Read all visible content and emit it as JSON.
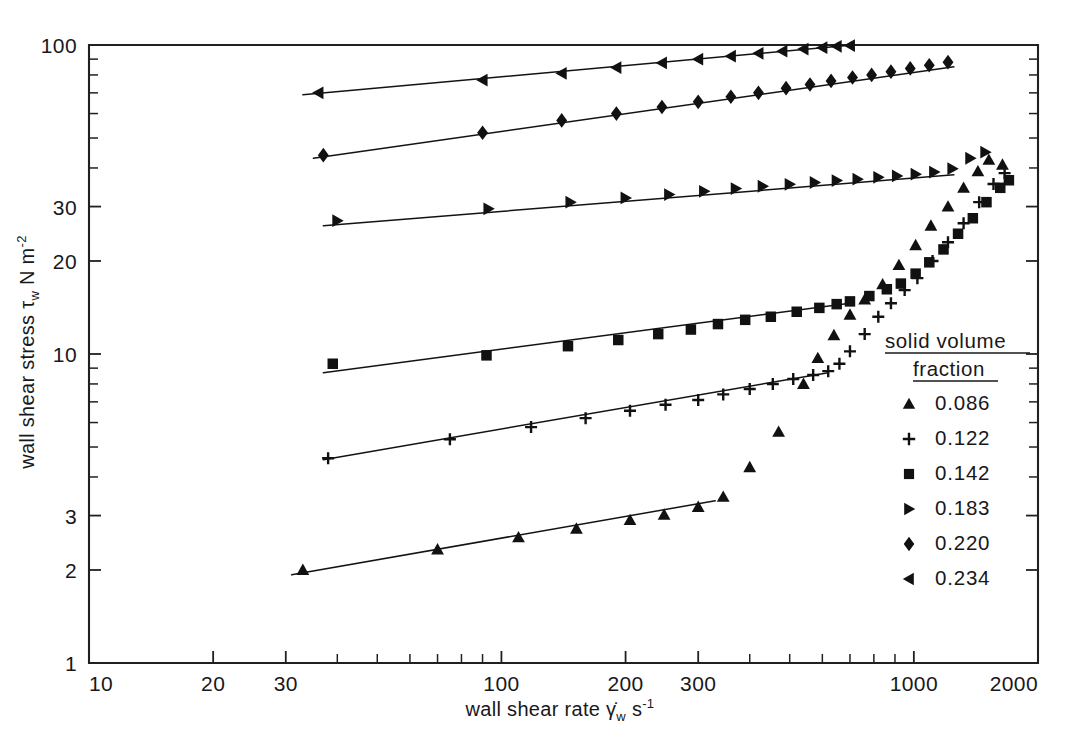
{
  "figure": {
    "background": "#ffffff",
    "ink_color": "#18181a"
  },
  "axes": {
    "x": {
      "title_prefix": "wall shear rate",
      "symbol": "γ̇",
      "symbol_sub": "w",
      "unit": "s",
      "unit_exponent": "-1",
      "scale": "log",
      "min": 10,
      "max": 2000,
      "tick_labels": [
        "10",
        "20",
        "30",
        "100",
        "200",
        "300",
        "1000",
        "2000"
      ],
      "tick_values": [
        10,
        20,
        30,
        100,
        200,
        300,
        1000,
        2000
      ],
      "minor_ticks": [
        40,
        50,
        60,
        70,
        80,
        90,
        400,
        500,
        600,
        700,
        800,
        900
      ]
    },
    "y": {
      "title_prefix": "wall shear stress",
      "symbol": "τ",
      "symbol_sub": "w",
      "unit": "N m",
      "unit_exponent": "-2",
      "scale": "log",
      "min": 1,
      "max": 100,
      "tick_labels": [
        "100",
        "30",
        "20",
        "10",
        "3",
        "2",
        "1"
      ],
      "tick_values": [
        100,
        30,
        20,
        10,
        3,
        2,
        1
      ],
      "minor_ticks": [
        90,
        80,
        70,
        60,
        50,
        40,
        9,
        8,
        7,
        6,
        5,
        4
      ]
    }
  },
  "legend": {
    "title_line1": "solid  volume",
    "title_line2": "fraction",
    "entries": [
      {
        "marker": "triangle-up",
        "label": "0.086"
      },
      {
        "marker": "plus",
        "label": "0.122"
      },
      {
        "marker": "square",
        "label": "0.142"
      },
      {
        "marker": "triangle-right",
        "label": "0.183"
      },
      {
        "marker": "diamond",
        "label": "0.220"
      },
      {
        "marker": "triangle-left",
        "label": "0.234"
      }
    ]
  },
  "chart_data": {
    "type": "scatter",
    "title": "",
    "xlabel": "wall shear rate γ̇w s⁻¹",
    "ylabel": "wall shear stress τw N m⁻²",
    "xscale": "log",
    "yscale": "log",
    "xlim": [
      10,
      2000
    ],
    "ylim": [
      1,
      100
    ],
    "grid": false,
    "legend_position": "right-inside",
    "legend_title": "solid volume fraction",
    "series": [
      {
        "name": "0.086",
        "marker": "triangle-up",
        "has_fit_line": true,
        "fit_line": {
          "x": [
            31,
            330
          ],
          "y": [
            1.93,
            3.35
          ]
        },
        "points": [
          {
            "x": 33,
            "y": 2.0
          },
          {
            "x": 70,
            "y": 2.33
          },
          {
            "x": 110,
            "y": 2.55
          },
          {
            "x": 152,
            "y": 2.72
          },
          {
            "x": 205,
            "y": 2.9
          },
          {
            "x": 248,
            "y": 3.02
          },
          {
            "x": 300,
            "y": 3.2
          },
          {
            "x": 345,
            "y": 3.45
          },
          {
            "x": 400,
            "y": 4.3
          },
          {
            "x": 470,
            "y": 5.6
          },
          {
            "x": 540,
            "y": 8.0
          },
          {
            "x": 585,
            "y": 9.7
          },
          {
            "x": 640,
            "y": 11.5
          },
          {
            "x": 700,
            "y": 13.4
          },
          {
            "x": 760,
            "y": 15.0
          },
          {
            "x": 840,
            "y": 16.8
          },
          {
            "x": 920,
            "y": 19.4
          },
          {
            "x": 1010,
            "y": 22.5
          },
          {
            "x": 1100,
            "y": 26.0
          },
          {
            "x": 1210,
            "y": 30.0
          },
          {
            "x": 1320,
            "y": 34.5
          },
          {
            "x": 1430,
            "y": 39.0
          },
          {
            "x": 1520,
            "y": 42.5
          },
          {
            "x": 1640,
            "y": 41.0
          }
        ]
      },
      {
        "name": "0.122",
        "marker": "plus",
        "has_fit_line": true,
        "fit_line": {
          "x": [
            37,
            620
          ],
          "y": [
            4.55,
            8.7
          ]
        },
        "points": [
          {
            "x": 38,
            "y": 4.6
          },
          {
            "x": 75,
            "y": 5.3
          },
          {
            "x": 118,
            "y": 5.8
          },
          {
            "x": 160,
            "y": 6.2
          },
          {
            "x": 205,
            "y": 6.55
          },
          {
            "x": 250,
            "y": 6.85
          },
          {
            "x": 300,
            "y": 7.1
          },
          {
            "x": 345,
            "y": 7.4
          },
          {
            "x": 400,
            "y": 7.7
          },
          {
            "x": 455,
            "y": 8.0
          },
          {
            "x": 510,
            "y": 8.3
          },
          {
            "x": 570,
            "y": 8.55
          },
          {
            "x": 620,
            "y": 8.8
          },
          {
            "x": 660,
            "y": 9.3
          },
          {
            "x": 700,
            "y": 10.2
          },
          {
            "x": 760,
            "y": 11.6
          },
          {
            "x": 820,
            "y": 13.2
          },
          {
            "x": 880,
            "y": 14.6
          },
          {
            "x": 950,
            "y": 16.1
          },
          {
            "x": 1020,
            "y": 17.6
          },
          {
            "x": 1110,
            "y": 20.0
          },
          {
            "x": 1210,
            "y": 23.0
          },
          {
            "x": 1320,
            "y": 26.5
          },
          {
            "x": 1440,
            "y": 31.0
          },
          {
            "x": 1560,
            "y": 35.5
          },
          {
            "x": 1660,
            "y": 38.5
          }
        ]
      },
      {
        "name": "0.142",
        "marker": "square",
        "has_fit_line": true,
        "fit_line": {
          "x": [
            37,
            700
          ],
          "y": [
            8.7,
            14.6
          ]
        },
        "points": [
          {
            "x": 39,
            "y": 9.3
          },
          {
            "x": 92,
            "y": 9.9
          },
          {
            "x": 145,
            "y": 10.6
          },
          {
            "x": 192,
            "y": 11.1
          },
          {
            "x": 240,
            "y": 11.6
          },
          {
            "x": 288,
            "y": 12.0
          },
          {
            "x": 335,
            "y": 12.5
          },
          {
            "x": 390,
            "y": 12.9
          },
          {
            "x": 450,
            "y": 13.2
          },
          {
            "x": 520,
            "y": 13.7
          },
          {
            "x": 590,
            "y": 14.1
          },
          {
            "x": 650,
            "y": 14.5
          },
          {
            "x": 700,
            "y": 14.8
          },
          {
            "x": 780,
            "y": 15.4
          },
          {
            "x": 860,
            "y": 16.2
          },
          {
            "x": 930,
            "y": 16.9
          },
          {
            "x": 1010,
            "y": 18.2
          },
          {
            "x": 1090,
            "y": 19.8
          },
          {
            "x": 1180,
            "y": 21.8
          },
          {
            "x": 1280,
            "y": 24.5
          },
          {
            "x": 1390,
            "y": 27.5
          },
          {
            "x": 1500,
            "y": 31.0
          },
          {
            "x": 1620,
            "y": 34.5
          },
          {
            "x": 1700,
            "y": 36.5
          }
        ]
      },
      {
        "name": "0.183",
        "marker": "triangle-right",
        "has_fit_line": true,
        "fit_line": {
          "x": [
            37,
            1250
          ],
          "y": [
            26.0,
            38.0
          ]
        },
        "points": [
          {
            "x": 40,
            "y": 27.0
          },
          {
            "x": 93,
            "y": 29.5
          },
          {
            "x": 147,
            "y": 31.0
          },
          {
            "x": 200,
            "y": 32.0
          },
          {
            "x": 255,
            "y": 32.8
          },
          {
            "x": 310,
            "y": 33.6
          },
          {
            "x": 370,
            "y": 34.3
          },
          {
            "x": 430,
            "y": 34.9
          },
          {
            "x": 500,
            "y": 35.4
          },
          {
            "x": 575,
            "y": 35.9
          },
          {
            "x": 650,
            "y": 36.4
          },
          {
            "x": 730,
            "y": 36.8
          },
          {
            "x": 820,
            "y": 37.3
          },
          {
            "x": 910,
            "y": 37.7
          },
          {
            "x": 1010,
            "y": 38.2
          },
          {
            "x": 1120,
            "y": 38.8
          },
          {
            "x": 1240,
            "y": 39.8
          },
          {
            "x": 1370,
            "y": 43.0
          },
          {
            "x": 1490,
            "y": 45.0
          }
        ]
      },
      {
        "name": "0.220",
        "marker": "diamond",
        "has_fit_line": true,
        "fit_line": {
          "x": [
            35,
            1250
          ],
          "y": [
            43.0,
            85.0
          ]
        },
        "points": [
          {
            "x": 37,
            "y": 44.0
          },
          {
            "x": 90,
            "y": 52.0
          },
          {
            "x": 140,
            "y": 57.0
          },
          {
            "x": 190,
            "y": 60.0
          },
          {
            "x": 245,
            "y": 63.0
          },
          {
            "x": 300,
            "y": 65.5
          },
          {
            "x": 360,
            "y": 68.0
          },
          {
            "x": 420,
            "y": 70.0
          },
          {
            "x": 490,
            "y": 72.5
          },
          {
            "x": 560,
            "y": 74.5
          },
          {
            "x": 630,
            "y": 76.5
          },
          {
            "x": 710,
            "y": 78.5
          },
          {
            "x": 790,
            "y": 80.0
          },
          {
            "x": 880,
            "y": 82.0
          },
          {
            "x": 980,
            "y": 84.0
          },
          {
            "x": 1090,
            "y": 86.0
          },
          {
            "x": 1210,
            "y": 88.0
          }
        ]
      },
      {
        "name": "0.234",
        "marker": "triangle-left",
        "has_fit_line": true,
        "fit_line": {
          "x": [
            33,
            710
          ],
          "y": [
            69.0,
            100.0
          ]
        },
        "points": [
          {
            "x": 36,
            "y": 70.0
          },
          {
            "x": 90,
            "y": 77.0
          },
          {
            "x": 140,
            "y": 81.0
          },
          {
            "x": 190,
            "y": 84.5
          },
          {
            "x": 245,
            "y": 87.5
          },
          {
            "x": 300,
            "y": 90.0
          },
          {
            "x": 360,
            "y": 92.0
          },
          {
            "x": 420,
            "y": 94.0
          },
          {
            "x": 480,
            "y": 95.5
          },
          {
            "x": 540,
            "y": 97.0
          },
          {
            "x": 600,
            "y": 98.0
          },
          {
            "x": 650,
            "y": 99.0
          },
          {
            "x": 700,
            "y": 99.6
          }
        ]
      }
    ]
  }
}
